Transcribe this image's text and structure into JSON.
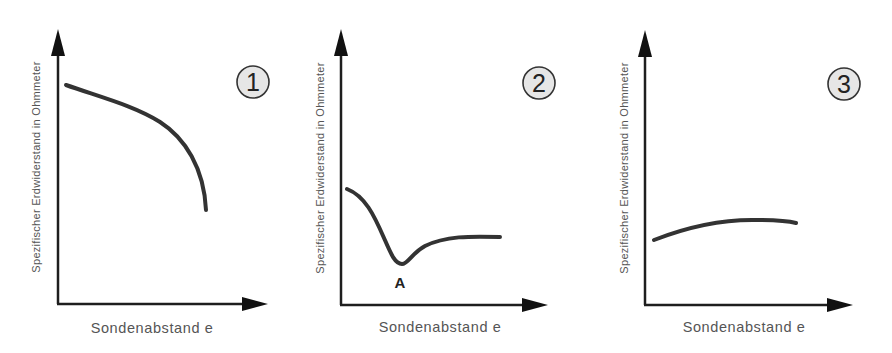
{
  "figure": {
    "panels": [
      {
        "id": "1",
        "badge": "1",
        "xlabel": "Sondenabstand e",
        "ylabel": "Spezifischer Erdwiderstand in Ohmmeter",
        "curve_shape": "decreasing, steeply falling at end"
      },
      {
        "id": "2",
        "badge": "2",
        "xlabel": "Sondenabstand e",
        "ylabel": "Spezifischer Erdwiderstand in Ohmmeter",
        "curve_shape": "dip to minimum then plateau",
        "annotation": "A"
      },
      {
        "id": "3",
        "badge": "3",
        "xlabel": "Sondenabstand e",
        "ylabel": "Spezifischer Erdwiderstand in Ohmmeter",
        "curve_shape": "slowly rising, flat"
      }
    ],
    "colors": {
      "axis": "#1e1e1e",
      "curve": "#333333",
      "label": "#555555",
      "badge_fill": "#e6e6e6"
    }
  }
}
